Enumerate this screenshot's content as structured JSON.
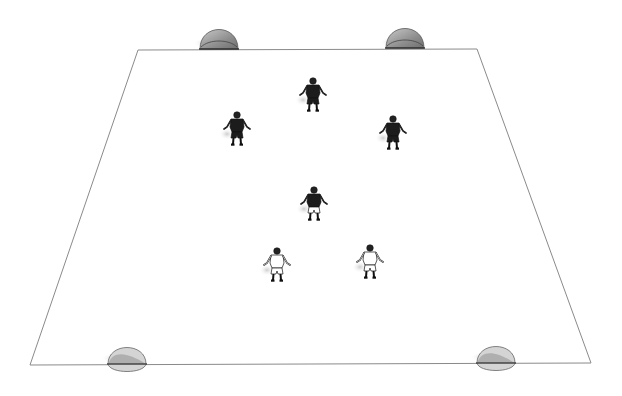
{
  "diagram": {
    "type": "soccer-drill",
    "background": "#ffffff",
    "field": {
      "corners": {
        "top_left": [
          138,
          50
        ],
        "top_right": [
          477,
          49
        ],
        "bottom_right": [
          591,
          363
        ],
        "bottom_left": [
          30,
          365
        ]
      },
      "line_color": "#8a8a8a"
    },
    "goals": [
      {
        "id": "goal-top-left",
        "x": 219,
        "y": 49,
        "side": "top"
      },
      {
        "id": "goal-top-right",
        "x": 405,
        "y": 48,
        "side": "top"
      },
      {
        "id": "goal-bottom-left",
        "x": 127,
        "y": 364,
        "side": "bottom"
      },
      {
        "id": "goal-bottom-right",
        "x": 496,
        "y": 363,
        "side": "bottom"
      }
    ],
    "players": [
      {
        "id": "dark-1",
        "team": "dark",
        "x": 313,
        "y": 96
      },
      {
        "id": "dark-2",
        "team": "dark",
        "x": 237,
        "y": 130
      },
      {
        "id": "dark-3",
        "team": "dark",
        "x": 393,
        "y": 134
      },
      {
        "id": "neutral-1",
        "team": "neutral",
        "x": 314,
        "y": 205
      },
      {
        "id": "light-1",
        "team": "light",
        "x": 277,
        "y": 266
      },
      {
        "id": "light-2",
        "team": "light",
        "x": 370,
        "y": 263
      }
    ],
    "colors": {
      "dark_kit": "#1c1c1c",
      "light_kit": "#ffffff",
      "outline": "#111111",
      "goal_fill": "#9a9a9a",
      "goal_light": "#d4d4d4"
    }
  }
}
